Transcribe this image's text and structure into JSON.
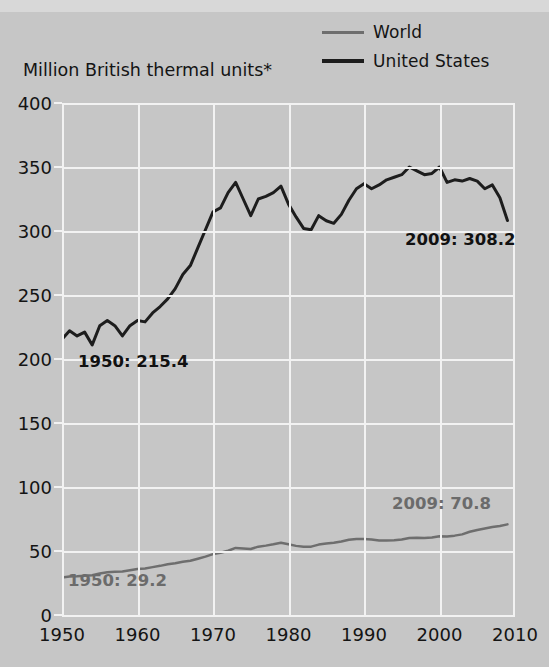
{
  "axis_title": "Million British thermal units*",
  "legend": {
    "items": [
      {
        "label": "World",
        "color": "#6e6e6e",
        "icon": "line-swatch-icon"
      },
      {
        "label": "United States",
        "color": "#1d1d1d",
        "icon": "line-swatch-icon"
      }
    ]
  },
  "annotations": [
    {
      "name": "us-1950-annotation",
      "text": "1950: 215.4",
      "color": "#111111"
    },
    {
      "name": "us-2009-annotation",
      "text": "2009: 308.2",
      "color": "#111111"
    },
    {
      "name": "world-1950-annotation",
      "text": "1950: 29.2",
      "color": "#6b6b6b"
    },
    {
      "name": "world-2009-annotation",
      "text": "2009: 70.8",
      "color": "#6b6b6b"
    }
  ],
  "chart_data": {
    "type": "line",
    "title": "",
    "subtitle": "",
    "xlabel": "",
    "ylabel": "Million British thermal units*",
    "xlim": [
      1950,
      2010
    ],
    "ylim": [
      0,
      400
    ],
    "ytick_labels": [
      "0",
      "50",
      "100",
      "150",
      "200",
      "250",
      "300",
      "350",
      "400"
    ],
    "yticks": [
      0,
      50,
      100,
      150,
      200,
      250,
      300,
      350,
      400
    ],
    "xtick_labels": [
      "1950",
      "1960",
      "1970",
      "1980",
      "1990",
      "2000",
      "2010"
    ],
    "xticks": [
      1950,
      1960,
      1970,
      1980,
      1990,
      2000,
      2010
    ],
    "grid": true,
    "grid_color": "#f2f2f2",
    "legend_position": "top-right",
    "x": [
      1950,
      1951,
      1952,
      1953,
      1954,
      1955,
      1956,
      1957,
      1958,
      1959,
      1960,
      1961,
      1962,
      1963,
      1964,
      1965,
      1966,
      1967,
      1968,
      1969,
      1970,
      1971,
      1972,
      1973,
      1974,
      1975,
      1976,
      1977,
      1978,
      1979,
      1980,
      1981,
      1982,
      1983,
      1984,
      1985,
      1986,
      1987,
      1988,
      1989,
      1990,
      1991,
      1992,
      1993,
      1994,
      1995,
      1996,
      1997,
      1998,
      1999,
      2000,
      2001,
      2002,
      2003,
      2004,
      2005,
      2006,
      2007,
      2008,
      2009
    ],
    "series": [
      {
        "name": "United States",
        "color": "#1d1d1d",
        "width": 3,
        "values": [
          215.4,
          222.0,
          218.0,
          221.0,
          211.0,
          226.0,
          230.0,
          226.0,
          218.0,
          226.0,
          230.0,
          229.0,
          236.0,
          241.0,
          247.0,
          255.0,
          266.0,
          273.0,
          287.0,
          301.0,
          315.0,
          318.0,
          330.0,
          338.0,
          325.0,
          312.0,
          325.0,
          327.0,
          330.0,
          335.0,
          321.0,
          311.0,
          302.0,
          301.0,
          312.0,
          308.0,
          306.0,
          313.0,
          324.0,
          333.0,
          337.0,
          333.0,
          336.0,
          340.0,
          342.0,
          344.0,
          350.0,
          347.0,
          344.0,
          345.0,
          350.0,
          338.0,
          340.0,
          339.0,
          341.0,
          339.0,
          333.0,
          336.0,
          326.0,
          308.2
        ],
        "start_label": "1950: 215.4",
        "end_label": "2009: 308.2"
      },
      {
        "name": "World",
        "color": "#6e6e6e",
        "width": 2.5,
        "values": [
          29.2,
          30.0,
          30.2,
          30.6,
          31.0,
          32.5,
          33.4,
          33.8,
          34.0,
          35.0,
          36.0,
          36.4,
          37.4,
          38.4,
          39.6,
          40.4,
          41.6,
          42.4,
          44.0,
          45.6,
          47.6,
          48.6,
          50.2,
          52.4,
          52.0,
          51.6,
          53.4,
          54.2,
          55.2,
          56.4,
          55.2,
          54.0,
          53.4,
          53.4,
          55.0,
          55.8,
          56.4,
          57.4,
          58.8,
          59.4,
          59.4,
          59.0,
          58.2,
          58.2,
          58.4,
          59.0,
          60.2,
          60.4,
          60.2,
          60.6,
          61.6,
          61.4,
          62.0,
          63.0,
          65.0,
          66.4,
          67.6,
          68.8,
          69.6,
          70.8
        ],
        "start_label": "1950: 29.2",
        "end_label": "2009: 70.8"
      }
    ]
  }
}
